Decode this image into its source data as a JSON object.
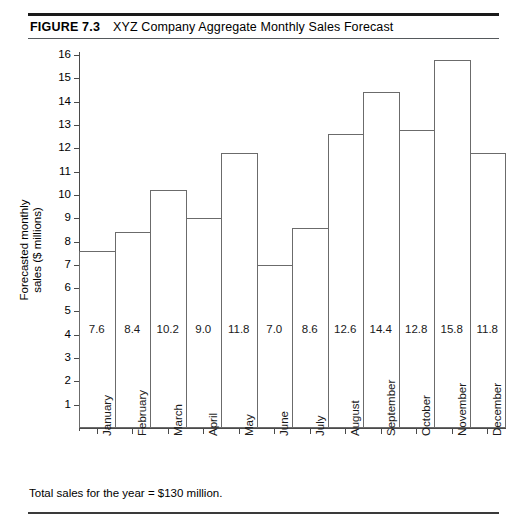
{
  "figure": {
    "label": "FIGURE 7.3",
    "title": "XYZ Company Aggregate Monthly Sales Forecast",
    "footer_note": "Total sales for the year  =  $130 million."
  },
  "chart_data": {
    "type": "bar",
    "title": "XYZ Company Aggregate Monthly Sales Forecast",
    "xlabel": "",
    "ylabel": "Forecasted monthly sales ($ millions)",
    "ylabel_line1": "Forecasted monthly",
    "ylabel_line2": "sales ($ millions)",
    "categories": [
      "January",
      "February",
      "March",
      "April",
      "May",
      "June",
      "July",
      "August",
      "September",
      "October",
      "November",
      "December"
    ],
    "values": [
      7.6,
      8.4,
      10.2,
      9.0,
      11.8,
      7.0,
      8.6,
      12.6,
      14.4,
      12.8,
      15.8,
      11.8
    ],
    "value_labels": [
      "7.6",
      "8.4",
      "10.2",
      "9.0",
      "11.8",
      "7.0",
      "8.6",
      "12.6",
      "14.4",
      "12.8",
      "15.8",
      "11.8"
    ],
    "ylim": [
      0,
      16
    ],
    "yticks": [
      16,
      15,
      14,
      13,
      12,
      11,
      10,
      9,
      8,
      7,
      6,
      5,
      4,
      3,
      2,
      1
    ],
    "ytick_labels": [
      "16",
      "15",
      "14",
      "13",
      "12",
      "11",
      "10",
      "9",
      "8",
      "7",
      "6",
      "5",
      "4",
      "3",
      "2",
      "1"
    ],
    "grid": false,
    "legend": null,
    "bar_style": "outlined-adjacent",
    "bar_fill_color": "#ffffff",
    "bar_edge_color": "#6b6b6b",
    "annotation": "Total sales for the year  =  $130 million."
  }
}
